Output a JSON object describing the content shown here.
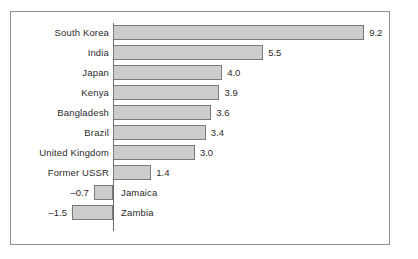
{
  "chart_data": {
    "type": "bar",
    "orientation": "horizontal",
    "title": "",
    "subtitle": "",
    "xlabel": "",
    "ylabel": "",
    "grid": false,
    "legend": null,
    "zero_axis": true,
    "xlim": [
      -1.5,
      9.2
    ],
    "categories": [
      "South Korea",
      "India",
      "Japan",
      "Kenya",
      "Bangladesh",
      "Brazil",
      "United Kingdom",
      "Former USSR",
      "Jamaica",
      "Zambia"
    ],
    "values": [
      9.2,
      5.5,
      4.0,
      3.9,
      3.6,
      3.4,
      3.0,
      1.4,
      -0.7,
      -1.5
    ],
    "value_labels": [
      "9.2",
      "5.5",
      "4.0",
      "3.9",
      "3.6",
      "3.4",
      "3.0",
      "1.4",
      "–0.7",
      "–1.5"
    ]
  },
  "style": {
    "bar_fill": "#cdcdcd",
    "bar_border": "#7a7a7a",
    "axis_color": "#6b6b6b",
    "frame_color": "#8e8e8e",
    "text_color": "#2b2b2b",
    "background": "#ffffff"
  }
}
